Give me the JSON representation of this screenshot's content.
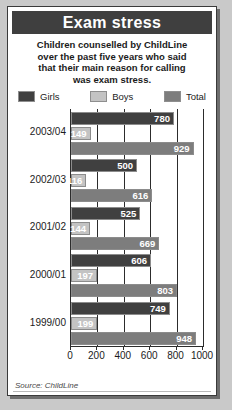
{
  "card": {
    "title": "Exam stress",
    "subtitle": "Children counselled by ChildLine over the past five years who said that their main reason for calling was exam stress.",
    "subtitle_lines": [
      "Children counselled by ChildLine",
      "over the past five years who said",
      "that their main reason for calling",
      "was exam stress."
    ],
    "source": "Source: ChildLine"
  },
  "legend": {
    "position": "top",
    "items": [
      {
        "label": "Girls",
        "color": "#404040"
      },
      {
        "label": "Boys",
        "color": "#c3c3c3"
      },
      {
        "label": "Total",
        "color": "#7d7d7d"
      }
    ]
  },
  "colors": {
    "girls": "#404040",
    "boys": "#c3c3c3",
    "total": "#7d7d7d",
    "title_bar": "#3f3f3f",
    "axis": "#2c2c2c",
    "card_background": "#ffffff",
    "page_background": "#c9c9c9",
    "value_text": "#ffffff"
  },
  "chart_data": {
    "type": "bar",
    "orientation": "horizontal",
    "title": "Exam stress",
    "subtitle": "Children counselled by ChildLine over the past five years who said that their main reason for calling was exam stress.",
    "xlabel": "",
    "ylabel": "",
    "xlim": [
      0,
      1000
    ],
    "xticks": [
      0,
      200,
      400,
      600,
      800,
      1000
    ],
    "xtick_labels": [
      "0",
      "200",
      "400",
      "600",
      "800",
      "1000"
    ],
    "grid": true,
    "legend_position": "top",
    "categories": [
      "2003/04",
      "2002/03",
      "2001/02",
      "2000/01",
      "1999/00"
    ],
    "series": [
      {
        "name": "Girls",
        "color": "#404040",
        "values": [
          780,
          500,
          525,
          606,
          749
        ]
      },
      {
        "name": "Boys",
        "color": "#c3c3c3",
        "values": [
          149,
          116,
          144,
          197,
          199
        ]
      },
      {
        "name": "Total",
        "color": "#7d7d7d",
        "values": [
          929,
          616,
          669,
          803,
          948
        ]
      }
    ],
    "source": "Source: ChildLine"
  }
}
